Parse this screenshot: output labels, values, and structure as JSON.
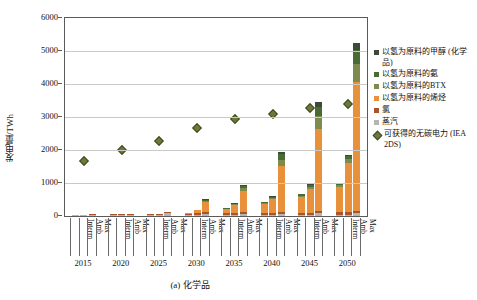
{
  "axes": {
    "ylabel": "发电量/TWh",
    "yticks": [
      0,
      1000,
      2000,
      3000,
      4000,
      5000,
      6000
    ],
    "ylim": [
      0,
      6000
    ],
    "scenario_labels": [
      "Interm",
      "Amb",
      "Max"
    ],
    "years": [
      "2015",
      "2020",
      "2025",
      "2030",
      "2035",
      "2040",
      "2045",
      "2050"
    ]
  },
  "caption": "(a) 化学品",
  "legend": [
    {
      "label": "以氢为原料的甲醇 (化学品)",
      "color": "#3c4a3a",
      "shape": "square"
    },
    {
      "label": "以氢为原料的氨",
      "color": "#4a6b33",
      "shape": "square"
    },
    {
      "label": "以氢为原料的BTX",
      "color": "#7d8c4e",
      "shape": "square"
    },
    {
      "label": "以氢为原料的烯烃",
      "color": "#e8903a",
      "shape": "square"
    },
    {
      "label": "氯",
      "color": "#a8552c",
      "shape": "square"
    },
    {
      "label": "蒸汽",
      "color": "#b5b5b5",
      "shape": "square"
    },
    {
      "label": "可获得的无碳电力 (IEA 2DS)",
      "color": "#6b7a3a",
      "shape": "diamond"
    }
  ],
  "colors": {
    "methanol": "#3c4a3a",
    "ammonia": "#4a6b33",
    "btx": "#7d8c4e",
    "olefins": "#e8903a",
    "chlorine": "#a8552c",
    "steam": "#b5b5b5",
    "marker": "#6b7a3a",
    "grid": "#c9c9c9",
    "frame": "#5a5a5a"
  },
  "chart_data": {
    "type": "bar",
    "title": "(a) 化学品",
    "xlabel": "",
    "ylabel": "发电量/TWh",
    "ylim": [
      0,
      6000
    ],
    "grid": true,
    "legend_position": "right",
    "stacked": true,
    "categories": [
      "2015 Interm",
      "2015 Amb",
      "2015 Max",
      "2020 Interm",
      "2020 Amb",
      "2020 Max",
      "2025 Interm",
      "2025 Amb",
      "2025 Max",
      "2030 Interm",
      "2030 Amb",
      "2030 Max",
      "2035 Interm",
      "2035 Amb",
      "2035 Max",
      "2040 Interm",
      "2040 Amb",
      "2040 Max",
      "2045 Interm",
      "2045 Amb",
      "2045 Max",
      "2050 Interm",
      "2050 Amb",
      "2050 Max"
    ],
    "series": [
      {
        "name": "蒸汽",
        "color": "#b5b5b5",
        "values": [
          10,
          10,
          25,
          15,
          15,
          40,
          20,
          25,
          90,
          25,
          30,
          60,
          25,
          30,
          60,
          30,
          35,
          70,
          35,
          40,
          80,
          40,
          45,
          90
        ]
      },
      {
        "name": "氯",
        "color": "#a8552c",
        "values": [
          25,
          25,
          25,
          35,
          35,
          35,
          45,
          45,
          45,
          50,
          50,
          50,
          55,
          55,
          55,
          60,
          60,
          60,
          65,
          65,
          65,
          70,
          70,
          70
        ]
      },
      {
        "name": "以氢为原料的烯烃",
        "color": "#e8903a",
        "values": [
          0,
          0,
          0,
          0,
          0,
          0,
          0,
          0,
          0,
          30,
          110,
          330,
          120,
          250,
          640,
          280,
          420,
          1380,
          480,
          720,
          2500,
          770,
          1480,
          3900
        ]
      },
      {
        "name": "以氢为原料的BTX",
        "color": "#7d8c4e",
        "values": [
          0,
          0,
          0,
          0,
          0,
          0,
          0,
          0,
          0,
          0,
          0,
          30,
          10,
          20,
          90,
          25,
          40,
          200,
          40,
          70,
          380,
          60,
          120,
          560
        ]
      },
      {
        "name": "以氢为原料的氨",
        "color": "#4a6b33",
        "values": [
          0,
          0,
          0,
          0,
          0,
          0,
          0,
          0,
          0,
          0,
          0,
          20,
          10,
          15,
          70,
          20,
          30,
          160,
          35,
          55,
          290,
          50,
          95,
          420
        ]
      },
      {
        "name": "以氢为原料的甲醇 (化学品)",
        "color": "#3c4a3a",
        "values": [
          0,
          0,
          0,
          0,
          0,
          0,
          0,
          0,
          0,
          0,
          0,
          10,
          5,
          8,
          35,
          10,
          15,
          80,
          18,
          28,
          145,
          25,
          48,
          210
        ]
      }
    ],
    "scatter": {
      "name": "可获得的无碳电力 (IEA 2DS)",
      "color": "#6b7a3a",
      "marker": "diamond",
      "x": [
        "2015 Amb",
        "2020 Amb",
        "2025 Amb",
        "2030 Amb",
        "2035 Amb",
        "2040 Amb",
        "2045 Amb",
        "2050 Amb"
      ],
      "values": [
        1680,
        2000,
        2270,
        2670,
        2930,
        3100,
        3270,
        3380
      ]
    }
  }
}
